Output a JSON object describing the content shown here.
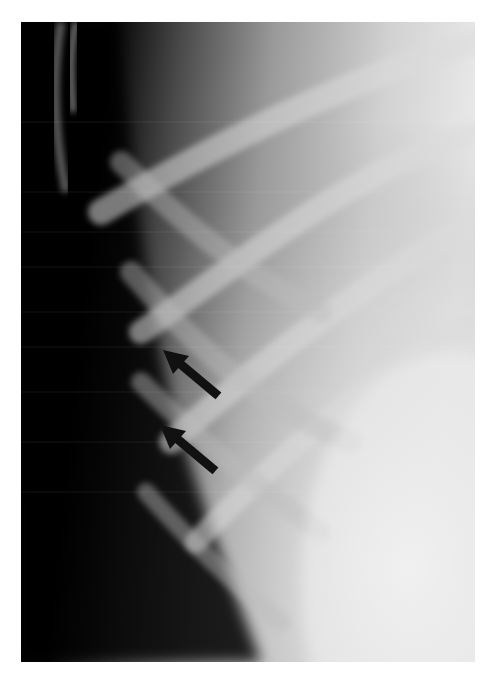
{
  "image": {
    "kind": "chest-radiograph",
    "view": "lateral chest wall / ribs",
    "annotations": [
      {
        "type": "arrow",
        "icon": "arrow-icon",
        "direction": "up-left",
        "tail": [
          215,
          393
        ],
        "head": [
          163,
          350
        ]
      },
      {
        "type": "arrow",
        "icon": "arrow-icon",
        "direction": "up-left",
        "tail": [
          212,
          468
        ],
        "head": [
          160,
          425
        ]
      }
    ],
    "colors": {
      "background": "#ffffff",
      "soft_tissue_dark": "#000000",
      "lung_light": "#e6e6e6",
      "arrow": "#111111"
    }
  }
}
